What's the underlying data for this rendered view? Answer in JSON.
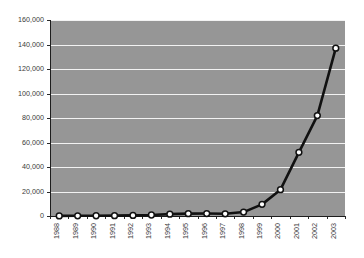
{
  "chart_data": {
    "type": "line",
    "title": "",
    "xlabel": "",
    "ylabel": "",
    "categories": [
      "1988",
      "1989",
      "1990",
      "1991",
      "1992",
      "1993",
      "1994",
      "1995",
      "1996",
      "1997",
      "1998",
      "1999",
      "2000",
      "2001",
      "2002",
      "2003"
    ],
    "values": [
      100,
      150,
      200,
      300,
      500,
      800,
      1500,
      1900,
      2000,
      1800,
      3200,
      9500,
      21500,
      52000,
      82000,
      137000
    ],
    "ylim": [
      0,
      160000
    ],
    "ytick_labels": [
      "0",
      "20,000",
      "40,000",
      "60,000",
      "80,000",
      "100,000",
      "120,000",
      "140,000",
      "160,000"
    ],
    "ytick_values": [
      0,
      20000,
      40000,
      60000,
      80000,
      100000,
      120000,
      140000,
      160000
    ],
    "grid": true,
    "legend": false,
    "marker": "circle",
    "colors": {
      "plot_background": "#969696",
      "figure_background": "#ffffff",
      "gridline": "#f2f2f2",
      "series_line": "#111111",
      "marker_fill": "#ffffff",
      "marker_stroke": "#111111",
      "axis": "#1d1d1d",
      "tick_text": "#3a3a3a"
    }
  }
}
